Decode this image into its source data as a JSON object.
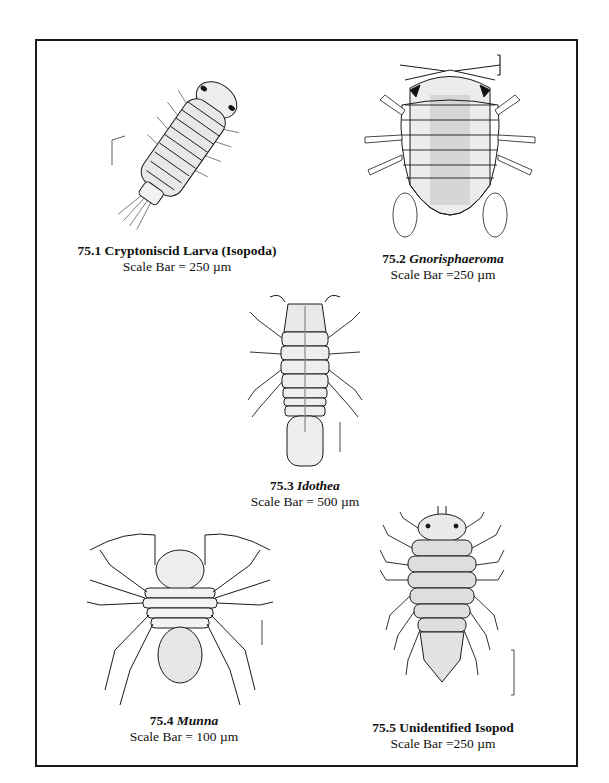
{
  "figures": [
    {
      "number": "75.1",
      "name": "Cryptoniscid Larva (Isopoda)",
      "italic": false,
      "scale": "Scale Bar = 250 µm"
    },
    {
      "number": "75.2",
      "name": "Gnorisphaeroma",
      "italic": true,
      "scale": "Scale Bar =250 µm"
    },
    {
      "number": "75.3",
      "name": "Idothea",
      "italic": true,
      "scale": "Scale Bar = 500 µm"
    },
    {
      "number": "75.4",
      "name": "Munna",
      "italic": true,
      "scale": "Scale Bar = 100 µm"
    },
    {
      "number": "75.5",
      "name": "Unidentified Isopod",
      "italic": false,
      "scale": "Scale Bar =250 µm"
    }
  ],
  "colors": {
    "ink": "#1a1a1a",
    "stipple": "#d9d9d9",
    "background": "#ffffff"
  }
}
